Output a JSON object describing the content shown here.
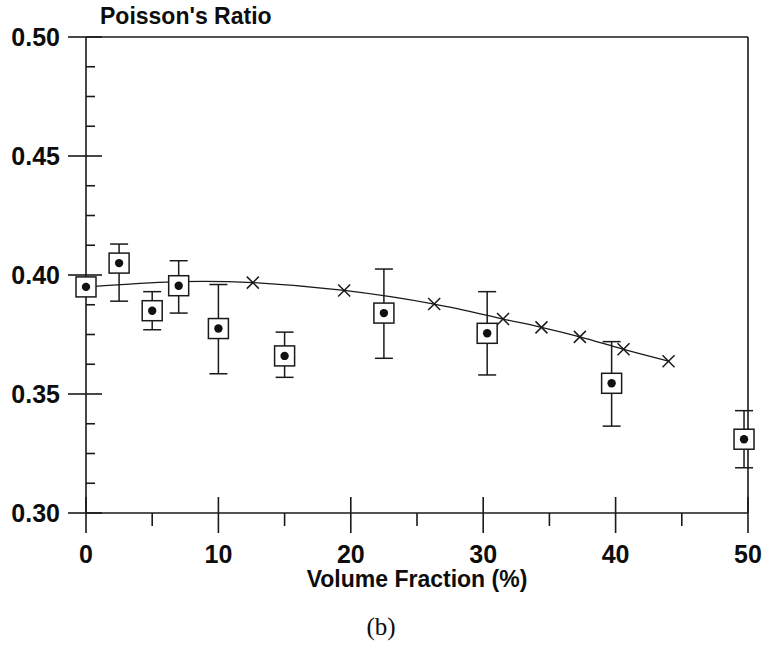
{
  "figure": {
    "panel_caption": "(b)",
    "title": "Poisson's Ratio",
    "xlabel": "Volume Fraction (%)"
  },
  "chart_data": {
    "type": "scatter",
    "title": "Poisson's Ratio",
    "subtitle": "",
    "xlabel": "Volume Fraction (%)",
    "ylabel": "Poisson's Ratio",
    "xlim": [
      0,
      50
    ],
    "ylim": [
      0.3,
      0.5
    ],
    "xticks": [
      0,
      10,
      20,
      30,
      40,
      50
    ],
    "xtick_labels": [
      "0",
      "10",
      "20",
      "30",
      "40",
      "50"
    ],
    "xminor_step": 5,
    "yticks": [
      0.3,
      0.35,
      0.4,
      0.45,
      0.5
    ],
    "ytick_labels": [
      "0.30",
      "0.35",
      "0.40",
      "0.45",
      "0.50"
    ],
    "yminor_step": 0.0125,
    "grid": false,
    "legend": "none",
    "series": [
      {
        "name": "Measured Poisson's ratio",
        "marker": "filled-circle-in-square",
        "has_error_bars": true,
        "points": [
          {
            "x": 0.0,
            "y": 0.395,
            "yerr_low": 0.395,
            "yerr_high": 0.395
          },
          {
            "x": 2.5,
            "y": 0.405,
            "yerr_low": 0.389,
            "yerr_high": 0.413
          },
          {
            "x": 5.0,
            "y": 0.385,
            "yerr_low": 0.377,
            "yerr_high": 0.393
          },
          {
            "x": 7.0,
            "y": 0.3955,
            "yerr_low": 0.384,
            "yerr_high": 0.406
          },
          {
            "x": 10.0,
            "y": 0.3775,
            "yerr_low": 0.3585,
            "yerr_high": 0.396
          },
          {
            "x": 15.0,
            "y": 0.366,
            "yerr_low": 0.357,
            "yerr_high": 0.376
          },
          {
            "x": 22.5,
            "y": 0.384,
            "yerr_low": 0.365,
            "yerr_high": 0.4025
          },
          {
            "x": 30.3,
            "y": 0.3755,
            "yerr_low": 0.358,
            "yerr_high": 0.393
          },
          {
            "x": 39.7,
            "y": 0.3545,
            "yerr_low": 0.3365,
            "yerr_high": 0.372
          },
          {
            "x": 49.7,
            "y": 0.331,
            "yerr_low": 0.319,
            "yerr_high": 0.343
          }
        ]
      },
      {
        "name": "Model prediction",
        "marker": "x",
        "has_error_bars": false,
        "line": true,
        "points": [
          {
            "x": 0.0,
            "y": 0.395
          },
          {
            "x": 7.0,
            "y": 0.3972
          },
          {
            "x": 12.6,
            "y": 0.3968
          },
          {
            "x": 19.5,
            "y": 0.3935
          },
          {
            "x": 26.3,
            "y": 0.3878
          },
          {
            "x": 31.5,
            "y": 0.3815
          },
          {
            "x": 34.4,
            "y": 0.378
          },
          {
            "x": 37.3,
            "y": 0.374
          },
          {
            "x": 40.6,
            "y": 0.3688
          },
          {
            "x": 44.0,
            "y": 0.3638
          }
        ]
      }
    ]
  }
}
